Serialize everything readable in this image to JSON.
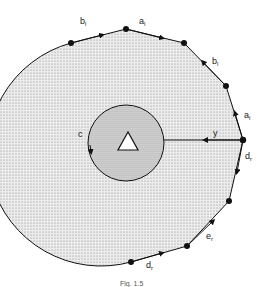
{
  "diagram": {
    "labels": {
      "b_top_left": {
        "base": "b",
        "sub": "l"
      },
      "a_top": {
        "base": "a",
        "sub": "l"
      },
      "b_right": {
        "base": "b",
        "sub": "l"
      },
      "a_right": {
        "base": "a",
        "sub": "l"
      },
      "c": "c",
      "y": "y",
      "d_right": {
        "base": "d",
        "sub": "r"
      },
      "e_lower": {
        "base": "e",
        "sub": "r"
      },
      "d_bottom": {
        "base": "d",
        "sub": "r"
      }
    },
    "center_marker": "triangle",
    "caption": "Fig. 1.5",
    "colors": {
      "stipple_outer": "#d8d8d8",
      "stipple_inner": "#c4c4c4",
      "line": "#111111"
    }
  }
}
